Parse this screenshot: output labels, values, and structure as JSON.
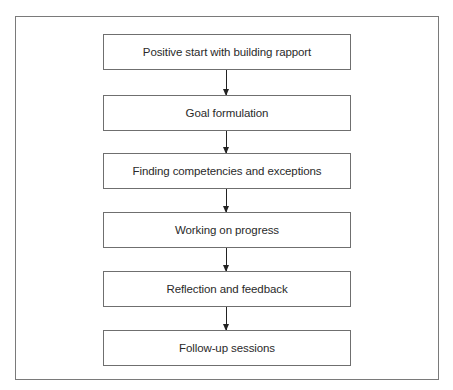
{
  "diagram": {
    "type": "flowchart",
    "direction": "top-to-bottom",
    "steps": [
      {
        "label": "Positive start with building rapport"
      },
      {
        "label": "Goal formulation"
      },
      {
        "label": "Finding competencies and exceptions"
      },
      {
        "label": "Working on progress"
      },
      {
        "label": "Reflection and feedback"
      },
      {
        "label": "Follow-up sessions"
      }
    ],
    "connectors": [
      {
        "from": 0,
        "to": 1
      },
      {
        "from": 1,
        "to": 2
      },
      {
        "from": 2,
        "to": 3
      },
      {
        "from": 3,
        "to": 4
      },
      {
        "from": 4,
        "to": 5
      }
    ]
  }
}
